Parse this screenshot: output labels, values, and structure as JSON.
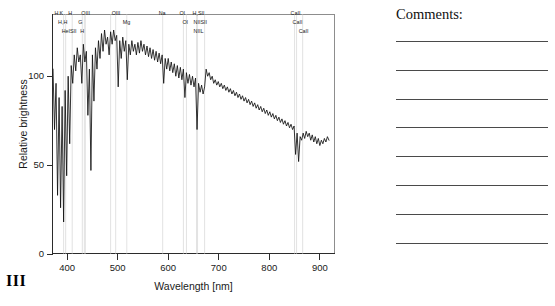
{
  "figure": {
    "number": "III"
  },
  "comments": {
    "title": "Comments:",
    "line_count": 8,
    "lines": [
      "",
      "",
      "",
      "",
      "",
      "",
      "",
      ""
    ]
  },
  "chart_data": {
    "type": "line",
    "title": "",
    "xlabel": "Wavelength [nm]",
    "ylabel": "Relative brightness",
    "xlim": [
      370,
      930
    ],
    "ylim": [
      0,
      135
    ],
    "xticks": [
      400,
      500,
      600,
      700,
      800,
      900
    ],
    "xtick_labels": [
      "400",
      "500",
      "600",
      "700",
      "800",
      "900"
    ],
    "yticks": [
      0,
      50,
      100
    ],
    "ytick_labels": [
      "0",
      "50",
      "100"
    ],
    "grid": false,
    "legend": "none",
    "series_name": "stellar spectrum",
    "line_color": "#111111",
    "guide_line_color": "#c9c9c9",
    "annotations": [
      {
        "label": "H",
        "wavelength": 383,
        "row": 0
      },
      {
        "label": "K",
        "wavelength": 393,
        "row": 0
      },
      {
        "label": "H",
        "wavelength": 410,
        "row": 0
      },
      {
        "label": "OIII",
        "wavelength": 436,
        "row": 0
      },
      {
        "label": "OIII",
        "wavelength": 496,
        "row": 0
      },
      {
        "label": "Na",
        "wavelength": 589,
        "row": 0
      },
      {
        "label": "OI",
        "wavelength": 630,
        "row": 0
      },
      {
        "label": "H,SII",
        "wavelength": 656,
        "row": 0
      },
      {
        "label": "CaII",
        "wavelength": 850,
        "row": 0
      },
      {
        "label": "H,H",
        "wavelength": 390,
        "row": 1
      },
      {
        "label": "G",
        "wavelength": 430,
        "row": 1
      },
      {
        "label": "Mg",
        "wavelength": 518,
        "row": 1
      },
      {
        "label": "OI",
        "wavelength": 636,
        "row": 1
      },
      {
        "label": "NIISII",
        "wavelength": 658,
        "row": 1
      },
      {
        "label": "CaII",
        "wavelength": 854,
        "row": 1
      },
      {
        "label": "HeISII",
        "wavelength": 397,
        "row": 2
      },
      {
        "label": "H",
        "wavelength": 434,
        "row": 2
      },
      {
        "label": "NIIL",
        "wavelength": 658,
        "row": 2
      },
      {
        "label": "CaII",
        "wavelength": 866,
        "row": 2
      }
    ],
    "guide_wavelengths": [
      393,
      397,
      410,
      430,
      434,
      436,
      486,
      496,
      518,
      589,
      630,
      636,
      656,
      658,
      672,
      850,
      854,
      866
    ],
    "x": [
      372,
      375,
      378,
      381,
      384,
      387,
      390,
      393,
      396,
      399,
      402,
      405,
      408,
      411,
      414,
      417,
      420,
      423,
      426,
      429,
      432,
      435,
      438,
      441,
      444,
      447,
      450,
      453,
      456,
      459,
      462,
      465,
      468,
      471,
      474,
      477,
      480,
      483,
      486,
      489,
      492,
      495,
      498,
      501,
      504,
      507,
      510,
      513,
      516,
      519,
      522,
      525,
      528,
      531,
      534,
      537,
      540,
      543,
      546,
      549,
      552,
      555,
      558,
      561,
      564,
      567,
      570,
      573,
      576,
      579,
      582,
      585,
      588,
      591,
      594,
      597,
      600,
      603,
      606,
      609,
      612,
      615,
      618,
      621,
      624,
      627,
      630,
      633,
      636,
      639,
      642,
      645,
      648,
      651,
      654,
      657,
      660,
      663,
      666,
      669,
      672,
      675,
      678,
      681,
      684,
      687,
      690,
      693,
      696,
      699,
      702,
      705,
      708,
      711,
      714,
      717,
      720,
      723,
      726,
      729,
      732,
      735,
      738,
      741,
      744,
      747,
      750,
      753,
      756,
      759,
      762,
      765,
      768,
      771,
      774,
      777,
      780,
      783,
      786,
      789,
      792,
      795,
      798,
      801,
      804,
      807,
      810,
      813,
      816,
      819,
      822,
      825,
      828,
      831,
      834,
      837,
      840,
      843,
      846,
      849,
      852,
      855,
      858,
      861,
      864,
      867,
      870,
      873,
      876,
      879,
      882,
      885,
      888,
      891,
      894,
      897,
      900,
      903,
      906,
      909,
      912,
      915,
      918,
      921
    ],
    "y": [
      104,
      70,
      96,
      33,
      88,
      26,
      83,
      18,
      92,
      44,
      100,
      62,
      106,
      96,
      112,
      103,
      116,
      108,
      112,
      96,
      118,
      108,
      114,
      78,
      104,
      47,
      112,
      86,
      116,
      104,
      120,
      110,
      124,
      114,
      126,
      118,
      122,
      112,
      125,
      118,
      126,
      120,
      123,
      94,
      120,
      110,
      122,
      114,
      120,
      98,
      118,
      112,
      120,
      114,
      118,
      112,
      119,
      113,
      120,
      114,
      118,
      112,
      117,
      111,
      116,
      110,
      115,
      109,
      114,
      108,
      113,
      107,
      112,
      96,
      110,
      104,
      110,
      103,
      108,
      102,
      107,
      100,
      106,
      99,
      105,
      98,
      104,
      88,
      102,
      96,
      101,
      95,
      100,
      94,
      99,
      70,
      96,
      91,
      95,
      90,
      94,
      104,
      100,
      102,
      98,
      100,
      96,
      98,
      95,
      97,
      94,
      96,
      93,
      95,
      92,
      94,
      91,
      93,
      90,
      92,
      89,
      91,
      88,
      90,
      87,
      89,
      86,
      88,
      85,
      87,
      84,
      86,
      83,
      85,
      82,
      84,
      81,
      83,
      80,
      82,
      79,
      81,
      78,
      80,
      77,
      79,
      76,
      78,
      75,
      77,
      74,
      76,
      73,
      75,
      72,
      74,
      71,
      73,
      70,
      72,
      56,
      68,
      52,
      66,
      64,
      68,
      65,
      69,
      66,
      68,
      64,
      67,
      63,
      66,
      62,
      65,
      61,
      64,
      62,
      65,
      63,
      66,
      64
    ]
  }
}
